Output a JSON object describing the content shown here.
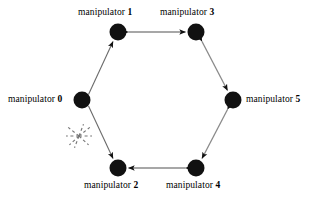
{
  "figure": {
    "kind": "ring-topology-diagram",
    "background_color": "#ffffff",
    "node_color": "#111111",
    "edge_color": "#555555",
    "broken_link_color": "#666666",
    "width": 316,
    "height": 199
  },
  "nodes": [
    {
      "id": 0,
      "label": "manipulator ",
      "index": "0",
      "cx": 82,
      "cy": 100,
      "r": 8.5,
      "label_position": "left"
    },
    {
      "id": 1,
      "label": "manipulator ",
      "index": "1",
      "cx": 118,
      "cy": 32,
      "r": 8.5,
      "label_position": "above"
    },
    {
      "id": 2,
      "label": "manipulator ",
      "index": "2",
      "cx": 118,
      "cy": 168,
      "r": 8.5,
      "label_position": "below"
    },
    {
      "id": 3,
      "label": "manipulator ",
      "index": "3",
      "cx": 196,
      "cy": 32,
      "r": 8.5,
      "label_position": "above"
    },
    {
      "id": 4,
      "label": "manipulator ",
      "index": "4",
      "cx": 196,
      "cy": 168,
      "r": 8.5,
      "label_position": "below"
    },
    {
      "id": 5,
      "label": "manipulator ",
      "index": "5",
      "cx": 233,
      "cy": 100,
      "r": 8.5,
      "label_position": "right"
    }
  ],
  "edges": [
    {
      "from": 0,
      "to": 1,
      "direction": "one-way",
      "broken": false,
      "name": "edge-0-1"
    },
    {
      "from": 0,
      "to": 2,
      "direction": "one-way",
      "broken": true,
      "name": "edge-0-2"
    },
    {
      "from": 1,
      "to": 3,
      "direction": "two-way",
      "broken": false,
      "name": "edge-1-3"
    },
    {
      "from": 3,
      "to": 5,
      "direction": "two-way",
      "broken": false,
      "name": "edge-3-5"
    },
    {
      "from": 5,
      "to": 4,
      "direction": "two-way",
      "broken": false,
      "name": "edge-5-4"
    },
    {
      "from": 4,
      "to": 2,
      "direction": "two-way",
      "broken": false,
      "name": "edge-4-2"
    }
  ],
  "broken_link_marker": {
    "name": "broken-link-starburst",
    "cx": 79,
    "cy": 136,
    "ray_count": 8,
    "ray_length": 13,
    "style": "dashed"
  }
}
